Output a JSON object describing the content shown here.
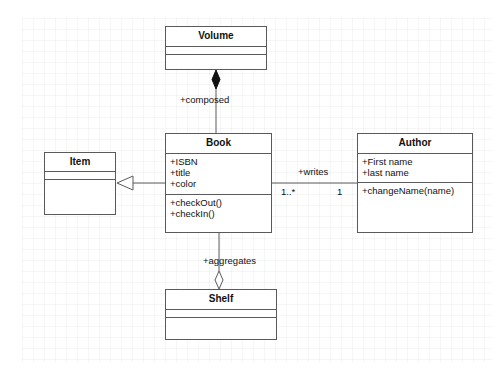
{
  "diagram": {
    "type": "UML class diagram",
    "classes": [
      {
        "id": "volume",
        "name": "Volume",
        "attributes": [],
        "operations": []
      },
      {
        "id": "book",
        "name": "Book",
        "attributes": [
          "+ISBN",
          "+title",
          "+color"
        ],
        "operations": [
          "+checkOut()",
          "+checkIn()"
        ]
      },
      {
        "id": "author",
        "name": "Author",
        "attributes": [
          "+First name",
          "+last name"
        ],
        "operations": [
          "+changeName(name)"
        ]
      },
      {
        "id": "item",
        "name": "Item",
        "attributes": [],
        "operations": []
      },
      {
        "id": "shelf",
        "name": "Shelf",
        "attributes": [],
        "operations": []
      }
    ],
    "relationships": [
      {
        "type": "composition",
        "from": "Book",
        "to": "Volume",
        "label": "+composed"
      },
      {
        "type": "association",
        "from": "Book",
        "to": "Author",
        "label": "+writes",
        "source_multiplicity": "1..*",
        "target_multiplicity": "1"
      },
      {
        "type": "generalization",
        "from": "Book",
        "to": "Item"
      },
      {
        "type": "aggregation",
        "from": "Book",
        "to": "Shelf",
        "label": "+aggregates"
      }
    ]
  },
  "colors": {
    "line": "#5a5a5a",
    "text": "#111111",
    "background": "#ffffff"
  }
}
